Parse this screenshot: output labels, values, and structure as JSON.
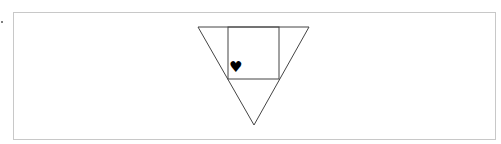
{
  "diagram": {
    "shapes": [
      {
        "type": "triangle",
        "orientation": "inverted",
        "points": [
          [
            198,
            27
          ],
          [
            309,
            27
          ],
          [
            254,
            125
          ]
        ],
        "stroke": "#444444"
      },
      {
        "type": "square",
        "points": [
          [
            228,
            27
          ],
          [
            279,
            27
          ],
          [
            279,
            79
          ],
          [
            228,
            79
          ]
        ],
        "stroke": "#444444"
      }
    ],
    "marker": {
      "symbol": "♥",
      "name": "heart",
      "color": "#000000"
    },
    "frame_color": "#c8c8c8"
  }
}
